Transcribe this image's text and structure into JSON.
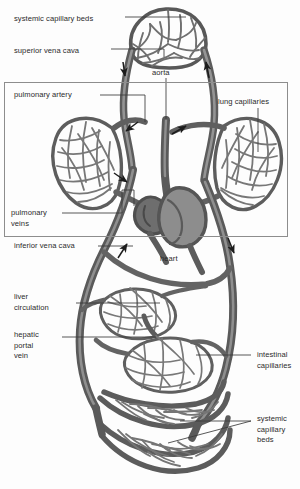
{
  "figure": {
    "style": "grayscale pencil/ink anatomical drawing",
    "background_color": "#fdfdfd",
    "vessel_dark_color": "#5d5d5d",
    "vessel_mid_color": "#7a7a7a",
    "vessel_light_color": "#9a9a9a",
    "label_color": "#2b2b2b",
    "leader_color": "#3a3a3a",
    "box_color": "#8d8d8d"
  },
  "labels": [
    {
      "id": "systemic-capillary-beds-top",
      "text": "systemic capillary beds",
      "x": 14,
      "y": 14,
      "align": "left"
    },
    {
      "id": "superior-vena-cava",
      "text": "superior vena cava",
      "x": 14,
      "y": 46,
      "align": "left"
    },
    {
      "id": "aorta",
      "text": "aorta",
      "x": 152,
      "y": 68,
      "align": "left"
    },
    {
      "id": "pulmonary-artery",
      "text": "pulmonary artery",
      "x": 14,
      "y": 92,
      "align": "left"
    },
    {
      "id": "lung-capillaries",
      "text": "lung capillaries",
      "x": 219,
      "y": 98,
      "align": "left"
    },
    {
      "id": "pulmonary-veins",
      "text": "pulmonary\nveins",
      "x": 11,
      "y": 209,
      "align": "left"
    },
    {
      "id": "inferior-vena-cava",
      "text": "inferior vena cava",
      "x": 14,
      "y": 243,
      "align": "left"
    },
    {
      "id": "heart",
      "text": "heart",
      "x": 160,
      "y": 256,
      "align": "left"
    },
    {
      "id": "liver-circulation",
      "text": "liver\ncirculation",
      "x": 14,
      "y": 293,
      "align": "left"
    },
    {
      "id": "hepatic-portal-vein",
      "text": "hepatic\nportal\nvein",
      "x": 14,
      "y": 331,
      "align": "left"
    },
    {
      "id": "intestinal-capillaries",
      "text": "intestinal\ncapillaries",
      "x": 257,
      "y": 351,
      "align": "left"
    },
    {
      "id": "systemic-capillary-beds-bot",
      "text": "systemic\ncapillary\nbeds",
      "x": 257,
      "y": 415,
      "align": "left"
    }
  ],
  "box": {
    "id": "pulmonary-circulation-box",
    "x": 4,
    "y": 82,
    "width": 284,
    "height": 155
  },
  "leaders": [
    {
      "id": "leader-systemic-top",
      "points": "125,17 186,17"
    },
    {
      "id": "leader-svc",
      "points": "111,49 164,49 164,57"
    },
    {
      "id": "leader-aorta",
      "points": "166,78 166,120"
    },
    {
      "id": "leader-pulmonary-artery",
      "points": "100,95 145,95 145,122"
    },
    {
      "id": "leader-lung-capillaries",
      "points": "258,108 258,152"
    },
    {
      "id": "leader-pulmonary-veins",
      "points": "62,213 122,213 122,190 132,190 132,206"
    },
    {
      "id": "leader-ivc",
      "points": "98,246 133,246"
    },
    {
      "id": "leader-liver",
      "points": "76,303 160,303"
    },
    {
      "id": "leader-hepatic",
      "points": "62,337 156,337"
    },
    {
      "id": "leader-intestinal",
      "points": "251,355 196,355"
    },
    {
      "id": "leader-systemic-bot-1",
      "points": "251,421 180,421"
    },
    {
      "id": "leader-systemic-bot-2",
      "points": "251,421 168,443"
    }
  ],
  "flow_arrows": [
    {
      "id": "arrow-descending-left",
      "x": 124,
      "y": 69,
      "angle": 105,
      "meaning": "blood flow down superior vena cava"
    },
    {
      "id": "arrow-ascending-right",
      "x": 207,
      "y": 69,
      "angle": 285,
      "meaning": "blood flow up aorta"
    },
    {
      "id": "arrow-pulmonary-left-1",
      "x": 127,
      "y": 130,
      "angle": 215,
      "meaning": "flow toward left lung"
    },
    {
      "id": "arrow-pulmonary-left-2",
      "x": 123,
      "y": 178,
      "angle": 150,
      "meaning": "flow from left lung"
    },
    {
      "id": "arrow-pulmonary-right",
      "x": 180,
      "y": 128,
      "angle": 335,
      "meaning": "flow toward right lung"
    },
    {
      "id": "arrow-ivc-up",
      "x": 124,
      "y": 251,
      "angle": 290,
      "meaning": "flow up inferior vena cava"
    },
    {
      "id": "arrow-aorta-down",
      "x": 232,
      "y": 248,
      "angle": 110,
      "meaning": "flow down descending aorta"
    }
  ]
}
